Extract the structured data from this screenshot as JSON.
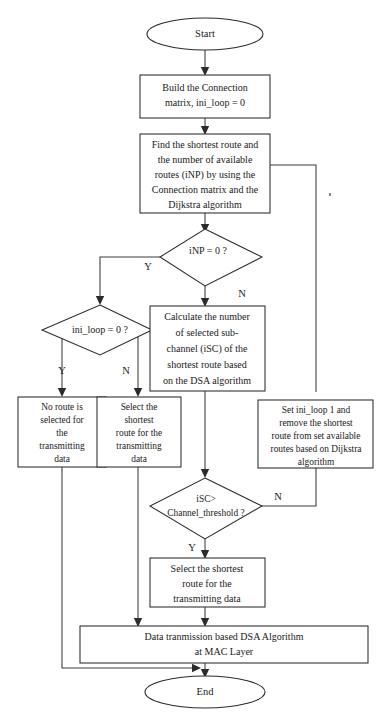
{
  "diagram": {
    "colors": {
      "stroke": "#2b2b2b",
      "connector": "#3a3a3a",
      "text": "#1a1a1a",
      "background": "#ffffff"
    }
  },
  "nodes": {
    "start": {
      "type": "terminator",
      "label": "Start"
    },
    "build_matrix": {
      "type": "process",
      "lines": [
        "Build the Connection",
        "matrix, ini_loop = 0"
      ]
    },
    "find_route": {
      "type": "process",
      "lines": [
        "Find the shortest route and",
        "the number of available",
        "routes (iNP) by using the",
        "Connection matrix and the",
        "Dijkstra algorithm"
      ]
    },
    "inp_zero": {
      "type": "decision",
      "lines": [
        "iNP = 0 ?"
      ]
    },
    "ini_loop_zero": {
      "type": "decision",
      "lines": [
        "ini_loop = 0 ?"
      ]
    },
    "calc_isc": {
      "type": "process",
      "lines": [
        "Calculate the number",
        "of selected sub-",
        "channel (iSC) of the",
        "shortest route based",
        "on the DSA algorithm"
      ]
    },
    "no_route": {
      "type": "process",
      "lines": [
        "No route is",
        "selected for",
        "the",
        "transmitting",
        "data"
      ]
    },
    "select_shortest_left": {
      "type": "process",
      "lines": [
        "Select the",
        "shortest",
        "route for the",
        "transmitting",
        "data"
      ]
    },
    "set_ini_loop": {
      "type": "process",
      "lines": [
        "Set ini_loop 1 and",
        "remove the shortest",
        "route from set available",
        "routes based on Dijkstra",
        "algorithm"
      ]
    },
    "isc_threshold": {
      "type": "decision",
      "lines": [
        "iSC>",
        "Channel_threshold ?"
      ]
    },
    "select_shortest_bottom": {
      "type": "process",
      "lines": [
        "Select the shortest",
        "route for the",
        "transmitting data"
      ]
    },
    "data_transmission": {
      "type": "process",
      "lines": [
        "Data tranmission based DSA Algorithm",
        "at MAC Layer"
      ]
    },
    "end": {
      "type": "terminator",
      "label": "End"
    }
  },
  "branch_labels": {
    "inp_yes": "Y",
    "inp_no": "N",
    "ini_loop_yes": "Y",
    "ini_loop_no": "N",
    "isc_yes": "Y",
    "isc_no": "N"
  }
}
